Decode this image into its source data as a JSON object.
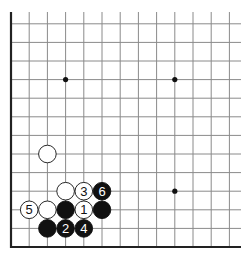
{
  "diagram": {
    "type": "go-board-fragment",
    "corner": "lower-left",
    "grid": {
      "columns": 13,
      "rows": 13,
      "x0": 11,
      "spacing_x": 18.2,
      "y_bottom": 247,
      "spacing_y": 18.6,
      "line_color": "#8a8a8a",
      "edge_color": "#222222"
    },
    "star_points": [
      {
        "col": 3,
        "row": 9
      },
      {
        "col": 9,
        "row": 9
      },
      {
        "col": 9,
        "row": 3
      }
    ],
    "stones": [
      {
        "color": "white",
        "col": 2,
        "row": 5,
        "label": ""
      },
      {
        "color": "white",
        "col": 3,
        "row": 3,
        "label": ""
      },
      {
        "color": "white",
        "col": 4,
        "row": 3,
        "label": "3"
      },
      {
        "color": "black",
        "col": 5,
        "row": 3,
        "label": "6"
      },
      {
        "color": "white",
        "col": 1,
        "row": 2,
        "label": "5"
      },
      {
        "color": "white",
        "col": 2,
        "row": 2,
        "label": ""
      },
      {
        "color": "black",
        "col": 3,
        "row": 2,
        "label": ""
      },
      {
        "color": "white",
        "col": 4,
        "row": 2,
        "label": "1"
      },
      {
        "color": "black",
        "col": 5,
        "row": 2,
        "label": ""
      },
      {
        "color": "black",
        "col": 2,
        "row": 1,
        "label": ""
      },
      {
        "color": "black",
        "col": 3,
        "row": 1,
        "label": "2"
      },
      {
        "color": "black",
        "col": 4,
        "row": 1,
        "label": "4"
      }
    ]
  }
}
